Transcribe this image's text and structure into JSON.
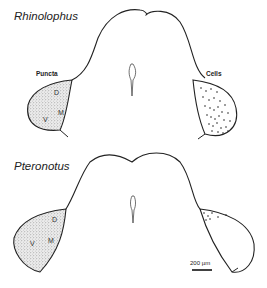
{
  "figure": {
    "top_panel": {
      "species": "Rhinolophus",
      "left_label": "Puncta",
      "right_label": "Cells",
      "regions": {
        "d": "D",
        "m": "M",
        "v": "V"
      }
    },
    "bottom_panel": {
      "species": "Pteronotus",
      "regions": {
        "d": "D",
        "m": "M",
        "v": "V"
      }
    },
    "scale_bar": {
      "label": "200 µm"
    },
    "colors": {
      "stroke": "#222222",
      "stipple": "#555555",
      "background": "#ffffff"
    }
  }
}
